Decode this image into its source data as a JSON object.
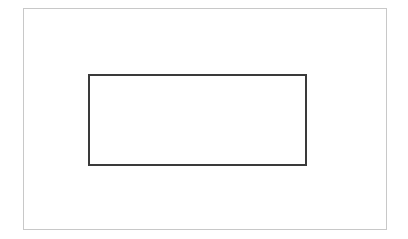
{
  "canvas": {
    "width": 408,
    "height": 239,
    "background_color": "#ffffff",
    "description": "Nested rectangles line drawing"
  },
  "shapes": [
    {
      "name": "outer-frame",
      "type": "rectangle",
      "x": 23,
      "y": 8,
      "width": 364,
      "height": 222,
      "stroke_color": "#c8c8c8",
      "stroke_width": 1,
      "fill": "none",
      "label": ""
    },
    {
      "name": "inner-rect",
      "type": "rectangle",
      "x": 88,
      "y": 74,
      "width": 219,
      "height": 92,
      "stroke_color": "#3a3a3a",
      "stroke_width": 2,
      "fill": "none",
      "label": ""
    }
  ],
  "annotations": {
    "outer_interior_text": "",
    "inner_interior_text": ""
  }
}
